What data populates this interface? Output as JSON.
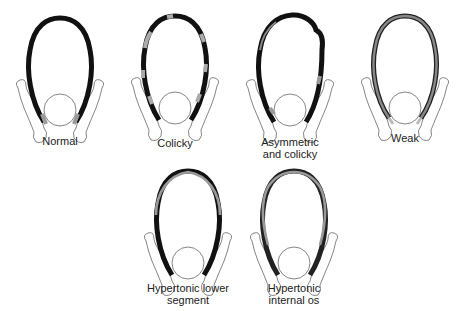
{
  "diagram": {
    "panels": [
      {
        "id": "normal",
        "label_lines": [
          "Normal"
        ]
      },
      {
        "id": "colicky",
        "label_lines": [
          "Colicky"
        ]
      },
      {
        "id": "asymmetric-colicky",
        "label_lines": [
          "Asymmetric",
          "and colicky"
        ]
      },
      {
        "id": "weak",
        "label_lines": [
          "Weak"
        ]
      },
      {
        "id": "hypertonic-lower-segment",
        "label_lines": [
          "Hypertonic lower",
          "segment"
        ]
      },
      {
        "id": "hypertonic-internal-os",
        "label_lines": [
          "Hypertonic",
          "internal os"
        ]
      }
    ],
    "colors": {
      "strong": "#111111",
      "weak": "#9a9a9a",
      "outline": "#555555"
    }
  }
}
